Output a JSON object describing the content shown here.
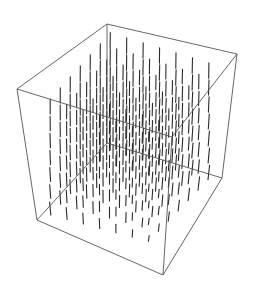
{
  "chart_data": {
    "type": "vector3d",
    "title": "",
    "xlabel": "",
    "ylabel": "",
    "zlabel": "",
    "axes_shown": false,
    "box_shown": true,
    "grid_points_per_axis": 7,
    "box_projection": {
      "top_back": [
        107,
        24
      ],
      "top_right": [
        237,
        54
      ],
      "top_left": [
        17,
        89
      ],
      "top_front": [
        172,
        137
      ],
      "bottom_back": [
        107,
        143
      ],
      "bottom_right": [
        222,
        178
      ],
      "bottom_left": [
        37,
        220
      ],
      "bottom_front": [
        163,
        275
      ]
    },
    "style": {
      "vector_color": "#2a2a2a",
      "box_color": "#555555",
      "background": "#ffffff"
    }
  }
}
